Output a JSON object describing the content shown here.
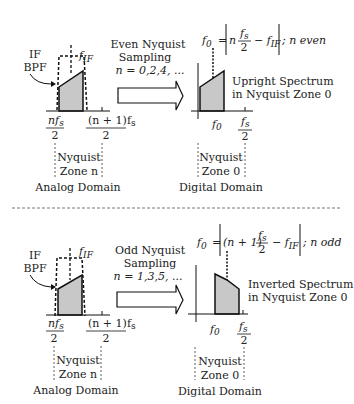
{
  "top": {
    "analog": {
      "bpf_label_1": "IF",
      "bpf_label_2": "BPF",
      "fif_label": "f",
      "fif_sub": "IF",
      "left_num": "nf",
      "left_num_sub": "s",
      "left_den": "2",
      "right_num": "(n + 1)f",
      "right_num_sub": "s",
      "right_den": "2",
      "zone_1": "Nyquist",
      "zone_2": "Zone n",
      "domain": "Analog Domain"
    },
    "arrow": {
      "line1": "Even Nyquist",
      "line2": "Sampling",
      "line3": "n = 0,2,4, ..."
    },
    "digital": {
      "formula": "f₀ = | n fₛ/2 − f_IF | ; n even",
      "formula_f0": "f",
      "formula_f0_sub": "0",
      "formula_eq": "=",
      "formula_n": "n",
      "formula_fs": "f",
      "formula_fs_sub": "s",
      "formula_den": "2",
      "formula_minus": "− f",
      "formula_fif_sub": "IF",
      "formula_tail": "; n even",
      "spectrum_1": "Upright Spectrum",
      "spectrum_2": "in Nyquist Zone 0",
      "f0_label": "f",
      "f0_sub": "0",
      "fs_num": "f",
      "fs_sub": "s",
      "fs_den": "2",
      "zone_1": "Nyquist",
      "zone_2": "Zone 0",
      "domain": "Digital Domain"
    }
  },
  "bottom": {
    "analog": {
      "bpf_label_1": "IF",
      "bpf_label_2": "BPF",
      "fif_label": "f",
      "fif_sub": "IF",
      "left_num": "nf",
      "left_num_sub": "s",
      "left_den": "2",
      "right_num": "(n + 1)f",
      "right_num_sub": "s",
      "right_den": "2",
      "zone_1": "Nyquist",
      "zone_2": "Zone n",
      "domain": "Analog Domain"
    },
    "arrow": {
      "line1": "Odd Nyquist",
      "line2": "Sampling",
      "line3": "n = 1,3,5, ..."
    },
    "digital": {
      "formula_f0": "f",
      "formula_f0_sub": "0",
      "formula_eq": "=",
      "formula_n": "(n + 1)",
      "formula_fs": "f",
      "formula_fs_sub": "s",
      "formula_den": "2",
      "formula_minus": "− f",
      "formula_fif_sub": "IF",
      "formula_tail": "; n odd",
      "spectrum_1": "Inverted Spectrum",
      "spectrum_2": "in Nyquist Zone 0",
      "f0_label": "f",
      "f0_sub": "0",
      "fs_num": "f",
      "fs_sub": "s",
      "fs_den": "2",
      "zone_1": "Nyquist",
      "zone_2": "Zone 0",
      "domain": "Digital Domain"
    }
  },
  "colors": {
    "fill": "#c8c8c8",
    "stroke": "#111111"
  }
}
